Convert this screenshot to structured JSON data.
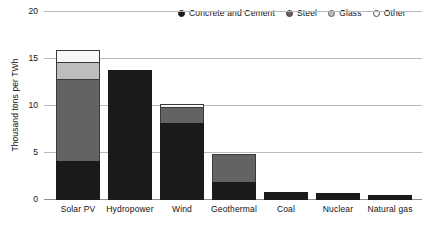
{
  "chart_data": {
    "type": "bar",
    "subtype": "stacked-bar",
    "title": "",
    "subtitle": "",
    "xlabel": "",
    "ylabel": "Thousand tons per TWh",
    "ylim": [
      0,
      20
    ],
    "yticks": [
      0,
      5,
      10,
      15,
      20
    ],
    "ytick_labels": [
      "0",
      "5",
      "10",
      "15",
      "20"
    ],
    "grid": true,
    "grid_axis": "y",
    "legend_position": "top-right",
    "categories": [
      "Solar PV",
      "Hydropower",
      "Wind",
      "Geothermal",
      "Coal",
      "Nuclear",
      "Natural gas"
    ],
    "series": [
      {
        "name": "Concrete and Cement",
        "color": "#1a1a1a",
        "marker": "filled-circle",
        "values": [
          4.15,
          13.8,
          8.2,
          1.9,
          0.85,
          0.75,
          0.55
        ]
      },
      {
        "name": "Steel",
        "color": "#636363",
        "marker": "filled-circle",
        "values": [
          8.85,
          0,
          1.8,
          3.1,
          0,
          0,
          0
        ]
      },
      {
        "name": "Glass",
        "color": "#bdbdbd",
        "marker": "filled-circle",
        "values": [
          1.9,
          0,
          0,
          0,
          0,
          0,
          0
        ]
      },
      {
        "name": "Other",
        "color": "#f7f7f7",
        "marker": "open-circle",
        "values": [
          1.4,
          0,
          0.4,
          0,
          0,
          0,
          0
        ]
      }
    ],
    "totals": [
      16.3,
      13.8,
      10.4,
      5.0,
      0.85,
      0.75,
      0.55
    ]
  },
  "legend": {
    "items": [
      {
        "label": "Concrete and Cement",
        "swatch": "legend-swatch-concrete-and-cement"
      },
      {
        "label": "Steel",
        "swatch": "legend-swatch-steel"
      },
      {
        "label": "Glass",
        "swatch": "legend-swatch-glass"
      },
      {
        "label": "Other",
        "swatch": "legend-swatch-other"
      }
    ]
  },
  "axes": {
    "y_title": "Thousand tons per TWh",
    "y_ticks": [
      "20",
      "15",
      "10",
      "5",
      "0"
    ],
    "x_ticks": [
      "Solar PV",
      "Hydropower",
      "Wind",
      "Geothermal",
      "Coal",
      "Nuclear",
      "Natural gas"
    ]
  },
  "colors": {
    "concrete": "#1a1a1a",
    "steel": "#636363",
    "glass": "#bdbdbd",
    "other": "#f7f7f7",
    "grid": "#b9b9b9",
    "axis": "#8f8f8f",
    "text": "#111111"
  }
}
